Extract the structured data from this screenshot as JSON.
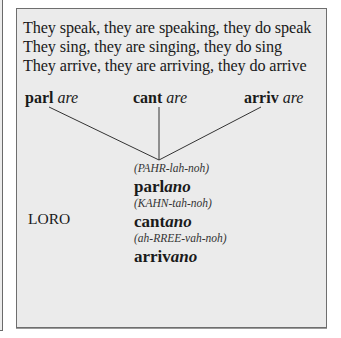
{
  "intro_lines": [
    "They speak, they are speaking, they do speak",
    "They sing, they are singing, they do sing",
    "They arrive, they are arriving, they do arrive"
  ],
  "stems": [
    {
      "root": "parl",
      "ending": "are"
    },
    {
      "root": "cant",
      "ending": "are"
    },
    {
      "root": "arriv",
      "ending": "are"
    }
  ],
  "pronoun": "LORO",
  "conjugations": [
    {
      "pronunciation": "(PAHR-lah-noh)",
      "root": "parl",
      "ending": "ano"
    },
    {
      "pronunciation": "(KAHN-tah-noh)",
      "root": "cant",
      "ending": "ano"
    },
    {
      "pronunciation": "(ah-RREE-vah-noh)",
      "root": "arriv",
      "ending": "ano"
    }
  ],
  "colors": {
    "card_background": "#ebebeb",
    "border": "#6e6e6e",
    "text": "#1a1a1a"
  }
}
